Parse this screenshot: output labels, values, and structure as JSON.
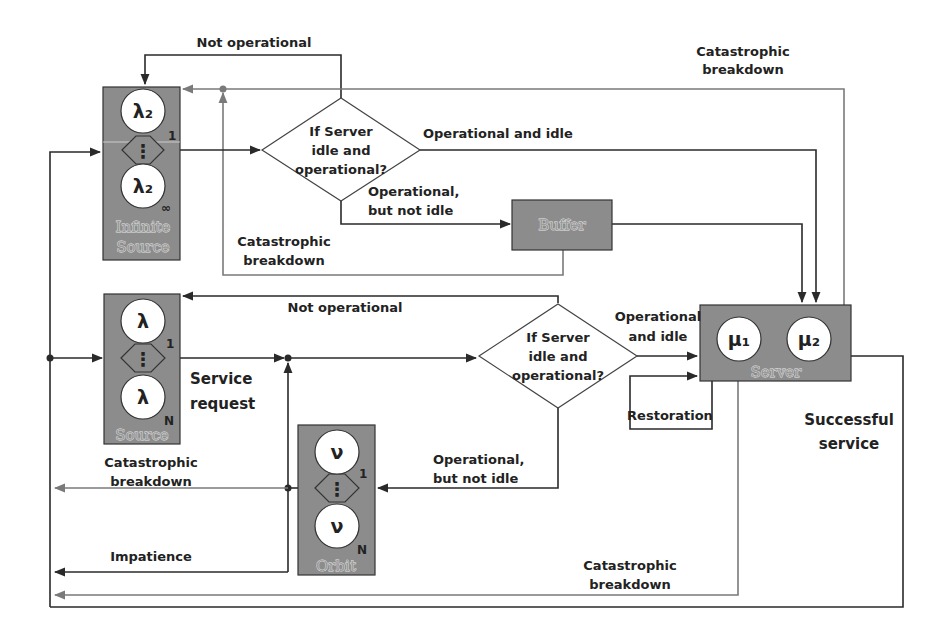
{
  "diagram": {
    "nodes": {
      "infinite_source": {
        "title_line1": "Infinite",
        "title_line2": "Source",
        "top_symbol": "λ₂",
        "top_index": "1",
        "bottom_symbol": "λ₂",
        "bottom_index": "∞",
        "dots": "⋮"
      },
      "source": {
        "title": "Source",
        "top_symbol": "λ",
        "top_index": "1",
        "bottom_symbol": "λ",
        "bottom_index": "N",
        "dots": "⋮"
      },
      "orbit": {
        "title": "Orbit",
        "top_symbol": "ν",
        "top_index": "1",
        "bottom_symbol": "ν",
        "bottom_index": "N",
        "dots": "⋮"
      },
      "buffer": {
        "title": "Buffer"
      },
      "server": {
        "title": "Server",
        "mu1": "μ₁",
        "mu2": "μ₂"
      },
      "decision_top": {
        "line1": "If Server",
        "line2": "idle and",
        "line3": "operational?"
      },
      "decision_bottom": {
        "line1": "If Server",
        "line2": "idle and",
        "line3": "operational?"
      }
    },
    "edge_labels": {
      "not_operational_top": "Not operational",
      "catastrophic_top_right_1": "Catastrophic",
      "catastrophic_top_right_2": "breakdown",
      "operational_idle_top": "Operational and idle",
      "operational_not_idle_top_1": "Operational,",
      "operational_not_idle_top_2": "but not idle",
      "catastrophic_buffer_1": "Catastrophic",
      "catastrophic_buffer_2": "breakdown",
      "not_operational_mid": "Not operational",
      "operational_idle_mid_1": "Operational",
      "operational_idle_mid_2": "and idle",
      "service_request_1": "Service",
      "service_request_2": "request",
      "restoration": "Restoration",
      "successful_service_1": "Successful",
      "successful_service_2": "service",
      "catastrophic_orbit_1": "Catastrophic",
      "catastrophic_orbit_2": "breakdown",
      "operational_not_idle_mid_1": "Operational,",
      "operational_not_idle_mid_2": "but not idle",
      "impatience": "Impatience",
      "catastrophic_bottom_1": "Catastrophic",
      "catastrophic_bottom_2": "breakdown"
    },
    "colors": {
      "node_fill": "#8c8c8c",
      "flow_line": "#2a2a2a",
      "breakdown_line": "#7a7a7a"
    }
  }
}
